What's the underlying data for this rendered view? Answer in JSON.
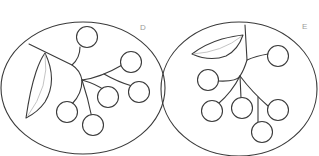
{
  "figure": {
    "panels": [
      {
        "id": "D",
        "label": "D",
        "frame_shape": "ellipse",
        "subject": "berry cluster with leaf",
        "berry_count": 6,
        "leaf_count": 1
      },
      {
        "id": "E",
        "label": "E",
        "frame_shape": "circle",
        "subject": "berry cluster with leaf",
        "berry_count": 6,
        "leaf_count": 1
      }
    ],
    "colors": {
      "line": "#3a3a3a",
      "vein": "#b5b5b5",
      "label": "#9a9a9a",
      "background": "#ffffff"
    }
  }
}
